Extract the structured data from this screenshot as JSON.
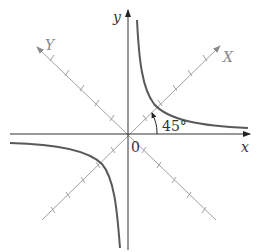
{
  "diagram": {
    "labels": {
      "x_axis": "x",
      "y_axis": "y",
      "rotated_x_axis": "X",
      "rotated_y_axis": "Y",
      "origin": "0",
      "angle": "45°"
    },
    "colors": {
      "axes": "#333333",
      "rotated_axes": "#999999",
      "curve": "#555555",
      "background": "#ffffff"
    },
    "rotation_angle_degrees": 45,
    "tick_count_per_rotated_half_axis": 5
  }
}
